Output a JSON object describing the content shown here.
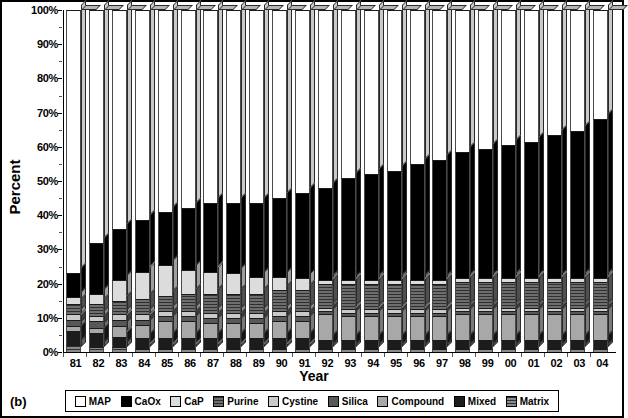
{
  "panel_label": "(b)",
  "axes": {
    "ylabel": "Percent",
    "xlabel": "Year",
    "yticks": [
      "0%",
      "10%",
      "20%",
      "30%",
      "40%",
      "50%",
      "60%",
      "70%",
      "80%",
      "90%",
      "100%"
    ]
  },
  "legend": {
    "items": [
      {
        "label": "MAP",
        "color": "#ffffff",
        "pattern": "solid"
      },
      {
        "label": "CaOx",
        "color": "#000000",
        "pattern": "solid"
      },
      {
        "label": "CaP",
        "color": "#dcdcdc",
        "pattern": "solid"
      },
      {
        "label": "Purine",
        "color": "#6e6e6e",
        "pattern": "hatch"
      },
      {
        "label": "Cystine",
        "color": "#cacaca",
        "pattern": "solid"
      },
      {
        "label": "Silica",
        "color": "#585858",
        "pattern": "solid"
      },
      {
        "label": "Compound",
        "color": "#a8a8a8",
        "pattern": "solid"
      },
      {
        "label": "Mixed",
        "color": "#1c1c1c",
        "pattern": "solid"
      },
      {
        "label": "Matrix",
        "color": "#8a8a8a",
        "pattern": "hatch"
      }
    ]
  },
  "chart_data": {
    "type": "bar",
    "subtype": "stacked-percent-3d",
    "title": "",
    "xlabel": "Year",
    "ylabel": "Percent",
    "ylim": [
      0,
      100
    ],
    "grid": false,
    "legend_position": "bottom",
    "categories": [
      "81",
      "82",
      "83",
      "84",
      "85",
      "86",
      "87",
      "88",
      "89",
      "90",
      "91",
      "92",
      "93",
      "94",
      "95",
      "96",
      "97",
      "98",
      "99",
      "00",
      "01",
      "02",
      "03",
      "04"
    ],
    "stack_order": [
      "Matrix",
      "Mixed",
      "Compound",
      "Silica",
      "Cystine",
      "Purine",
      "CaP",
      "CaOx",
      "MAP"
    ],
    "series": [
      {
        "name": "Matrix",
        "color": "#8a8a8a",
        "values": [
          2.0,
          1.5,
          1.5,
          1.0,
          1.0,
          1.0,
          1.0,
          1.0,
          1.0,
          1.0,
          1.0,
          1.0,
          1.0,
          1.0,
          1.0,
          1.0,
          1.0,
          1.0,
          1.0,
          1.0,
          1.0,
          1.0,
          1.0,
          1.0
        ]
      },
      {
        "name": "Mixed",
        "color": "#1c1c1c",
        "values": [
          4.0,
          4.0,
          3.0,
          3.0,
          3.0,
          3.0,
          3.0,
          3.0,
          3.0,
          3.0,
          3.0,
          2.5,
          2.5,
          2.5,
          2.5,
          2.5,
          2.5,
          2.5,
          2.5,
          2.5,
          2.5,
          2.5,
          2.5,
          2.5
        ]
      },
      {
        "name": "Compound",
        "color": "#a8a8a8",
        "values": [
          1.5,
          1.5,
          3.0,
          4.0,
          5.0,
          5.0,
          4.5,
          4.5,
          4.5,
          5.0,
          5.0,
          7.5,
          7.0,
          7.0,
          7.0,
          7.0,
          7.0,
          7.5,
          7.5,
          7.5,
          7.5,
          7.5,
          7.5,
          7.5
        ]
      },
      {
        "name": "Silica",
        "color": "#585858",
        "values": [
          2.0,
          2.0,
          2.0,
          1.5,
          1.5,
          1.5,
          1.5,
          1.5,
          1.5,
          1.5,
          1.5,
          1.0,
          1.0,
          1.0,
          1.0,
          1.0,
          1.0,
          1.0,
          1.0,
          1.0,
          1.0,
          1.0,
          1.0,
          1.0
        ]
      },
      {
        "name": "Cystine",
        "color": "#cacaca",
        "values": [
          1.5,
          1.5,
          1.5,
          1.5,
          1.5,
          1.5,
          1.5,
          1.5,
          1.5,
          1.5,
          1.5,
          1.0,
          1.0,
          1.0,
          1.0,
          1.0,
          1.0,
          1.0,
          1.0,
          1.0,
          1.0,
          1.0,
          1.0,
          1.0
        ]
      },
      {
        "name": "Purine",
        "color": "#6e6e6e",
        "values": [
          3.0,
          3.5,
          4.0,
          4.5,
          4.5,
          5.0,
          5.5,
          5.5,
          5.5,
          6.0,
          6.0,
          7.0,
          7.5,
          7.5,
          7.5,
          7.5,
          7.5,
          7.5,
          7.5,
          7.5,
          7.5,
          7.5,
          7.5,
          7.5
        ]
      },
      {
        "name": "CaP",
        "color": "#dcdcdc",
        "values": [
          2.0,
          3.0,
          6.0,
          8.0,
          9.0,
          7.0,
          6.5,
          6.0,
          5.0,
          4.0,
          3.5,
          1.0,
          1.0,
          1.0,
          1.0,
          1.0,
          1.0,
          1.0,
          1.0,
          1.0,
          1.0,
          1.0,
          1.0,
          1.0
        ]
      },
      {
        "name": "CaOx",
        "color": "#000000",
        "values": [
          7.0,
          15.0,
          15.0,
          15.0,
          15.5,
          18.0,
          20.0,
          20.5,
          21.5,
          23.0,
          25.0,
          27.0,
          30.0,
          31.0,
          32.0,
          34.0,
          35.0,
          37.0,
          38.0,
          39.0,
          40.0,
          42.0,
          43.0,
          46.5
        ]
      },
      {
        "name": "MAP",
        "color": "#ffffff",
        "values": [
          77.0,
          68.0,
          64.0,
          61.5,
          59.0,
          58.0,
          56.5,
          56.5,
          56.5,
          55.0,
          53.5,
          52.0,
          49.0,
          48.0,
          47.0,
          45.0,
          44.0,
          41.5,
          40.5,
          39.5,
          38.5,
          36.5,
          35.5,
          32.0
        ]
      }
    ],
    "cumulative_tops": {
      "note": "Top of CaOx (= 100 - MAP) per year, percent",
      "values": [
        23.0,
        32.0,
        36.0,
        38.5,
        41.0,
        42.0,
        43.5,
        43.5,
        43.5,
        45.0,
        46.5,
        48.0,
        51.0,
        52.0,
        53.0,
        55.0,
        56.0,
        58.5,
        59.5,
        60.5,
        61.5,
        63.5,
        64.5,
        68.0
      ]
    }
  }
}
